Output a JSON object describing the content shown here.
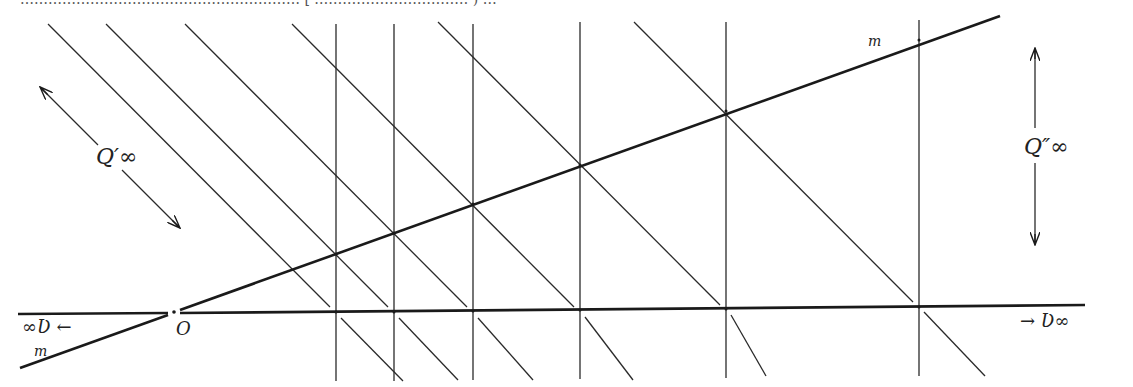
{
  "caption_fragment": "…………………………………………………… [ …………………………… ) …",
  "labels": {
    "q_prime": "Q′∞",
    "q_double": "Q″∞",
    "v_left": "∞Ʋ ←",
    "v_right": "→ Ʋ∞",
    "origin": "O",
    "m_top": "m",
    "m_bottom": "m"
  },
  "geometry": {
    "horizontal_axis": {
      "x1": 18,
      "y1": 314,
      "x2": 1085,
      "y2": 305
    },
    "line_m": {
      "x1": 20,
      "y1": 368,
      "x2": 1000,
      "y2": 16,
      "passes_through": "O"
    },
    "origin_point": {
      "x": 174,
      "y": 313
    },
    "vertical_lines_x": [
      336,
      394,
      473,
      580,
      726,
      919
    ],
    "diagonal_intersections_x": [
      336,
      394,
      473,
      580,
      726,
      919
    ],
    "colors": {
      "ink": "#1a1a1a",
      "paper": "#ffffff"
    }
  }
}
